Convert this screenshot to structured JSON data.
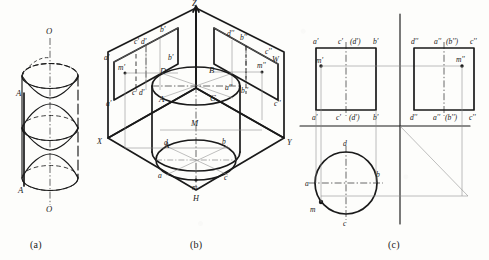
{
  "figure": {
    "captions": [
      {
        "id": "a",
        "label": "(a)"
      },
      {
        "id": "b",
        "label": "(b)"
      },
      {
        "id": "c",
        "label": "(c)"
      }
    ]
  },
  "part_a": {
    "name": "pictorial-cylinder",
    "labels": {
      "axis_top": "O",
      "axis_bottom": "O",
      "point_upper": "A",
      "point_lower": "A"
    }
  },
  "part_b": {
    "name": "isometric-three-plane-projection",
    "axis_labels": {
      "z": "Z",
      "x": "X",
      "y": "Y",
      "h": "H",
      "w": "W"
    },
    "v_plane_labels": {
      "a_prime_left": "a'",
      "cd_prime_top": "c' d'",
      "b_prime_top": "b'",
      "m_prime": "m'",
      "a_prime_bottom": "a'",
      "cd_prime_bottom": "c' d'",
      "b_prime_bottom": "b'"
    },
    "w_plane_labels": {
      "d_top": "d''",
      "a_top": "a''",
      "b_top": "b''",
      "c_top": "c''",
      "m_double": "m''",
      "a_bottom": "a''",
      "b_bottom": "b''",
      "c_bottom": "c''",
      "d_bottom": "d''"
    },
    "solid_labels": {
      "top_left": "D",
      "top_right": "B",
      "front_left": "A",
      "front_right": "C",
      "center": "M",
      "side_a": "A"
    },
    "h_plane_labels": {
      "d": "d",
      "b": "b",
      "a": "a",
      "c": "c",
      "m": "m"
    }
  },
  "part_c": {
    "name": "orthographic-three-view-projection",
    "front_view": {
      "top_labels": [
        "a'",
        "c'",
        "(d')",
        "b'"
      ],
      "bottom_labels": [
        "a'",
        "c'",
        "(d')",
        "b'"
      ],
      "point_label": "m'"
    },
    "side_view": {
      "top_labels": [
        "d''",
        "a''",
        "(b'')",
        "c''"
      ],
      "bottom_labels": [
        "d''",
        "a''",
        "(b'')",
        "c''"
      ],
      "point_label": "m''"
    },
    "top_view": {
      "labels": {
        "d": "d",
        "b": "b",
        "a": "a",
        "c": "c",
        "m": "m"
      }
    }
  },
  "colors": {
    "ink": "#1a1a1a",
    "thin": "#6b6b6b",
    "paper": "#fdfdfb"
  }
}
